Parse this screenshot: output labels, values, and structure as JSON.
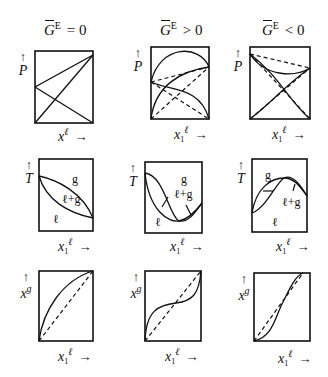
{
  "columns": [
    {
      "symbol": "G",
      "superscript": "E",
      "relation": "= 0"
    },
    {
      "symbol": "G",
      "superscript": "E",
      "relation": "> 0"
    },
    {
      "symbol": "G",
      "superscript": "E",
      "relation": "< 0"
    }
  ],
  "axes": {
    "pressure": "P",
    "temperature": "T",
    "x_symbol": "x",
    "x_sub": "1",
    "x_liquid_sup": "ℓ",
    "x_gas_sup": "g",
    "arrow_up": "↑",
    "arrow_right": "→"
  },
  "regions": {
    "gas": "g",
    "two_phase": "ℓ+g",
    "liquid": "ℓ"
  },
  "rows": [
    {
      "name": "P-x diagrams",
      "ylabel": "P",
      "xlabel": "x1^ℓ"
    },
    {
      "name": "T-x diagrams",
      "ylabel": "T",
      "xlabel": "x1^ℓ"
    },
    {
      "name": "x-y diagrams",
      "ylabel": "x1^g",
      "xlabel": "x1^ℓ"
    }
  ],
  "colors": {
    "ink": "#111111",
    "background": "#ffffff"
  }
}
